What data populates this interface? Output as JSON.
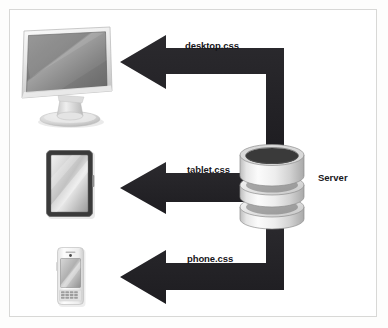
{
  "figure": {
    "background_color": "#ffffff",
    "frame_color": "#d8d8d6",
    "arrow_color": "#232226",
    "text_color": "#17161a"
  },
  "nodes": [
    {
      "id": "server",
      "label": "Server",
      "icon": "database-stack-icon",
      "role": "source"
    },
    {
      "id": "desktop",
      "label": "",
      "icon": "desktop-monitor-icon",
      "role": "target"
    },
    {
      "id": "tablet",
      "label": "",
      "icon": "tablet-icon",
      "role": "target"
    },
    {
      "id": "phone",
      "label": "",
      "icon": "smartphone-icon",
      "role": "target"
    }
  ],
  "connections": [
    {
      "id": "desktop-connection",
      "label": "desktop.css",
      "from": "server",
      "to": "desktop",
      "shape": "elbow-up-left",
      "arrowhead": "left"
    },
    {
      "id": "tablet-connection",
      "label": "tablet.css",
      "from": "server",
      "to": "tablet",
      "shape": "straight-left",
      "arrowhead": "left"
    },
    {
      "id": "phone-connection",
      "label": "phone.css",
      "from": "server",
      "to": "phone",
      "shape": "elbow-down-left",
      "arrowhead": "left"
    }
  ],
  "labels": {
    "desktop_css": "desktop.css",
    "tablet_css": "tablet.css",
    "phone_css": "phone.css",
    "server": "Server"
  }
}
